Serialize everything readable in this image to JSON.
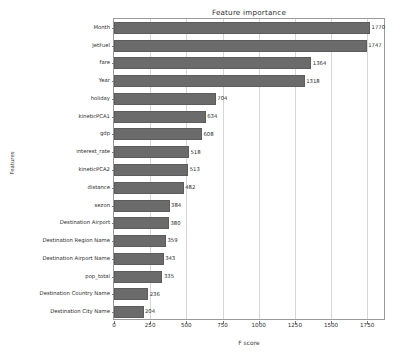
{
  "chart_data": {
    "type": "bar",
    "orientation": "horizontal",
    "title": "Feature importance",
    "xlabel": "F score",
    "ylabel": "Features",
    "grid": true,
    "legend": "none",
    "xlim": [
      0,
      1880
    ],
    "xticks": [
      0,
      250,
      500,
      750,
      1000,
      1250,
      1500,
      1750
    ],
    "categories": [
      "Month",
      "JetFuel",
      "fare",
      "Year",
      "holiday",
      "kineticPCA1",
      "gdp",
      "interest_rate",
      "kineticPCA2",
      "distance",
      "sezon",
      "Destination Airport",
      "Destination Region Name",
      "Destination Airport Name",
      "pop_total",
      "Destination Country Name",
      "Destination City Name"
    ],
    "values": [
      1770,
      1747,
      1364,
      1318,
      704,
      634,
      608,
      518,
      513,
      482,
      384,
      380,
      359,
      343,
      335,
      236,
      204
    ],
    "value_labels": [
      "1770",
      "1747",
      "1364",
      "1318",
      "704",
      "634",
      "608",
      "518",
      "513",
      "482",
      "384",
      "380",
      "359",
      "343",
      "335",
      "236",
      "204"
    ],
    "bar_color": "#6b6b6b",
    "background_color": "#ffffff",
    "grid_color": "#d6d6d6",
    "axis_color": "#9a9a9a"
  }
}
